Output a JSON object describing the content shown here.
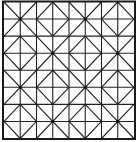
{
  "figure": {
    "grid_cells": 8,
    "block_cells": 2,
    "motifs": [
      "star",
      "diamond"
    ],
    "line_color": "#222222",
    "background_color": "#ffffff"
  }
}
